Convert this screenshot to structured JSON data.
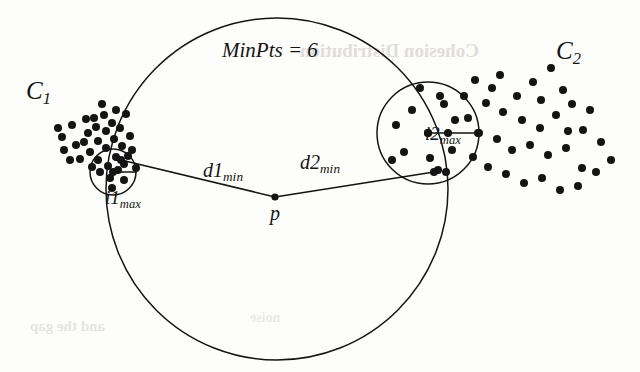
{
  "figure": {
    "caption_labels": {
      "cluster_left": "C",
      "cluster_left_sub": "1",
      "cluster_right": "C",
      "cluster_right_sub": "2",
      "minpts": "MinPts = 6",
      "d1": "d1",
      "d1_sub": "min",
      "d2": "d2",
      "d2_sub": "min",
      "point_p": "p",
      "i1": "i1",
      "i1_sub": "max",
      "i2": "i2",
      "i2_sub": "max"
    },
    "ghost_text": {
      "line1": "Cohesion Distribution",
      "line2": "and the  gap",
      "line3": "noise"
    },
    "colors": {
      "ink": "#141414",
      "paper": "#fdfdfb",
      "ghost": "#c9c6c0"
    },
    "geometry": {
      "big_circle": {
        "cx": 277,
        "cy": 189,
        "r": 171,
        "stroke_width": 1.5
      },
      "circle_i1max": {
        "cx": 113,
        "cy": 172,
        "r": 23,
        "stroke_width": 1.5
      },
      "circle_i2max": {
        "cx": 428,
        "cy": 133,
        "r": 51,
        "stroke_width": 1.5
      },
      "point_p": {
        "x": 275,
        "y": 197,
        "r": 3.6
      },
      "radius_arrow_i1max": {
        "x1": 113,
        "y1": 172,
        "x2": 136,
        "y2": 172
      },
      "radius_arrow_i2max": {
        "x1": 428,
        "y1": 133,
        "x2": 479,
        "y2": 133
      },
      "segment_d1min": {
        "x1": 275,
        "y1": 197,
        "x2": 121,
        "y2": 160
      },
      "segment_d2min": {
        "x1": 275,
        "y1": 197,
        "x2": 434,
        "y2": 172
      },
      "dot_radius": 4.0
    },
    "cluster_left_points": [
      [
        62,
        137
      ],
      [
        72,
        125
      ],
      [
        76,
        145
      ],
      [
        86,
        119
      ],
      [
        88,
        133
      ],
      [
        90,
        152
      ],
      [
        96,
        127
      ],
      [
        98,
        141
      ],
      [
        98,
        160
      ],
      [
        64,
        150
      ],
      [
        104,
        115
      ],
      [
        106,
        131
      ],
      [
        106,
        148
      ],
      [
        108,
        166
      ],
      [
        112,
        123
      ],
      [
        114,
        139
      ],
      [
        116,
        157
      ],
      [
        120,
        128
      ],
      [
        122,
        146
      ],
      [
        124,
        164
      ],
      [
        126,
        114
      ],
      [
        80,
        159
      ],
      [
        92,
        167
      ],
      [
        100,
        172
      ],
      [
        110,
        178
      ],
      [
        118,
        170
      ],
      [
        128,
        156
      ],
      [
        84,
        142
      ],
      [
        70,
        160
      ],
      [
        130,
        136
      ],
      [
        132,
        150
      ],
      [
        94,
        118
      ],
      [
        102,
        104
      ],
      [
        116,
        110
      ],
      [
        58,
        128
      ],
      [
        124,
        180
      ],
      [
        112,
        188
      ],
      [
        136,
        168
      ]
    ],
    "cluster_right_points": [
      [
        475,
        80
      ],
      [
        500,
        75
      ],
      [
        517,
        96
      ],
      [
        533,
        82
      ],
      [
        541,
        100
      ],
      [
        551,
        68
      ],
      [
        563,
        90
      ],
      [
        486,
        103
      ],
      [
        503,
        112
      ],
      [
        522,
        120
      ],
      [
        540,
        128
      ],
      [
        556,
        115
      ],
      [
        572,
        104
      ],
      [
        583,
        130
      ],
      [
        468,
        118
      ],
      [
        478,
        133
      ],
      [
        497,
        139
      ],
      [
        512,
        150
      ],
      [
        530,
        145
      ],
      [
        548,
        155
      ],
      [
        566,
        148
      ],
      [
        582,
        168
      ],
      [
        601,
        142
      ],
      [
        473,
        157
      ],
      [
        488,
        167
      ],
      [
        506,
        174
      ],
      [
        524,
        183
      ],
      [
        542,
        178
      ],
      [
        560,
        190
      ],
      [
        578,
        186
      ],
      [
        596,
        172
      ],
      [
        611,
        160
      ],
      [
        464,
        96
      ],
      [
        492,
        88
      ],
      [
        568,
        131
      ],
      [
        590,
        110
      ],
      [
        452,
        150
      ],
      [
        455,
        120
      ],
      [
        440,
        96
      ],
      [
        446,
        172
      ]
    ],
    "circle_i2max_points": [
      [
        396,
        125
      ],
      [
        412,
        110
      ],
      [
        428,
        133
      ],
      [
        448,
        133
      ],
      [
        404,
        152
      ],
      [
        430,
        158
      ],
      [
        444,
        104
      ],
      [
        420,
        88
      ],
      [
        438,
        170
      ],
      [
        392,
        160
      ]
    ]
  }
}
